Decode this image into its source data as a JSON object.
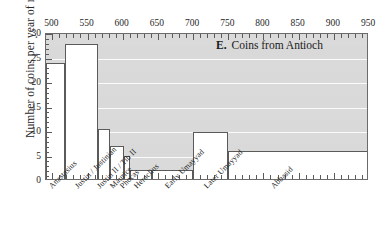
{
  "chart_data": {
    "type": "bar",
    "title_letter": "E.",
    "title_words": "Coins from Antioch",
    "xlabel": "",
    "ylabel": "Number of coins per year of reign",
    "xlim": [
      491,
      950
    ],
    "ylim": [
      0,
      30
    ],
    "grid": true,
    "legend": null,
    "x_axis_position": "top",
    "xticks": [
      500,
      550,
      600,
      650,
      700,
      750,
      800,
      850,
      900,
      950
    ],
    "xticklabels": [
      "500",
      "550",
      "600",
      "650",
      "700",
      "750",
      "800",
      "850",
      "900",
      "950"
    ],
    "xminortick_interval": 10,
    "yticks": [
      0,
      5,
      10,
      15,
      20,
      25,
      30
    ],
    "yticklabels": [
      "0",
      "5",
      "10",
      "15",
      "20",
      "25",
      "30"
    ],
    "yminortick_interval": 1,
    "categories": [
      "Anastasius",
      "Justin / Justinian",
      "Justin II / Tib II",
      "Maurice",
      "Phocas",
      "Heraclius",
      "Early Umayyad",
      "Later Umayyad",
      "Abbasid"
    ],
    "values": [
      24.0,
      27.9,
      10.7,
      7.2,
      5.2,
      2.2,
      2.2,
      10.0,
      6.1
    ],
    "bins": [
      {
        "label": "Anastasius",
        "start": 491,
        "end": 518,
        "value": 24.0
      },
      {
        "label": "Justin / Justinian",
        "start": 518,
        "end": 565,
        "value": 27.9
      },
      {
        "label": "Justin II / Tib II",
        "start": 565,
        "end": 582,
        "value": 10.7
      },
      {
        "label": "Maurice",
        "start": 582,
        "end": 602,
        "value": 7.2
      },
      {
        "label": "Phocas",
        "start": 602,
        "end": 610,
        "value": 5.2
      },
      {
        "label": "Heraclius",
        "start": 610,
        "end": 641,
        "value": 2.2
      },
      {
        "label": "Early Umayyad",
        "start": 641,
        "end": 700,
        "value": 2.2
      },
      {
        "label": "Later Umayyad",
        "start": 700,
        "end": 750,
        "value": 10.0
      },
      {
        "label": "Abbasid",
        "start": 750,
        "end": 950,
        "value": 6.1
      }
    ],
    "colors": {
      "plot_background": "#d9d9d9",
      "gridline": "#fbfbfb",
      "step_fill": "#ffffff",
      "step_line": "#5a5a5a",
      "axis": "#6b6b6b",
      "text": "#262626"
    }
  }
}
